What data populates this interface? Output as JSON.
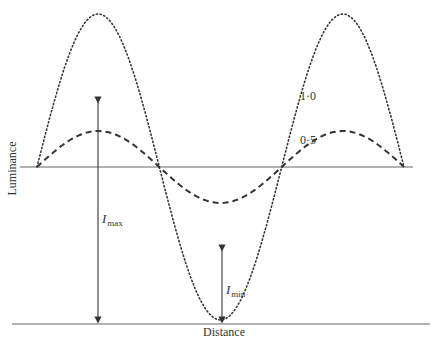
{
  "figure": {
    "x_axis_label": "Distance",
    "y_axis_label": "Luminance",
    "curve_labels": [
      {
        "id": "high-contrast",
        "label": "1·0",
        "style": "dotted"
      },
      {
        "id": "low-contrast",
        "label": "0·5",
        "style": "dashed"
      }
    ],
    "annotations": {
      "imax": {
        "symbol": "I",
        "subscript": "max"
      },
      "imin": {
        "symbol": "I",
        "subscript": "min"
      }
    },
    "colors": {
      "line": "#333333",
      "axis": "#555555"
    }
  },
  "chart_data": {
    "type": "line",
    "title": "",
    "xlabel": "Distance",
    "ylabel": "Luminance",
    "series": [
      {
        "name": "1·0",
        "style": "dotted",
        "mean": 0.5,
        "amplitude": 0.5,
        "contrast": 1.0,
        "periods": 1.5
      },
      {
        "name": "0·5",
        "style": "dashed",
        "mean": 0.5,
        "amplitude": 0.25,
        "contrast": 0.5,
        "periods": 1.5
      }
    ],
    "annotations": [
      "Imax",
      "Imin"
    ]
  }
}
